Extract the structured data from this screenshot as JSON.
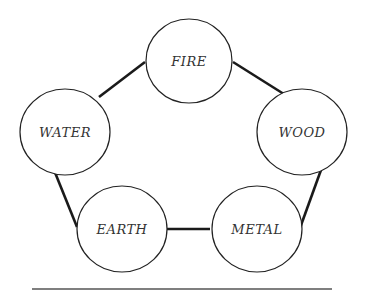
{
  "diagram": {
    "type": "cycle",
    "stroke_color": "#1a1a1a",
    "node_stroke_color": "#222222",
    "label_color": "#333333",
    "nodes": [
      {
        "id": "fire",
        "label": "FIRE",
        "cx": 189,
        "cy": 61,
        "rx": 43,
        "ry": 42
      },
      {
        "id": "wood",
        "label": "WOOD",
        "cx": 302,
        "cy": 132,
        "rx": 45,
        "ry": 43
      },
      {
        "id": "metal",
        "label": "METAL",
        "cx": 257,
        "cy": 229,
        "rx": 45,
        "ry": 43
      },
      {
        "id": "earth",
        "label": "EARTH",
        "cx": 122,
        "cy": 229,
        "rx": 45,
        "ry": 43
      },
      {
        "id": "water",
        "label": "WATER",
        "cx": 65,
        "cy": 132,
        "rx": 45,
        "ry": 43
      }
    ],
    "edges": [
      {
        "from": "water",
        "to": "fire",
        "x1": 99,
        "y1": 97,
        "x2": 145,
        "y2": 62
      },
      {
        "from": "fire",
        "to": "wood",
        "x1": 233,
        "y1": 62,
        "x2": 287,
        "y2": 96
      },
      {
        "from": "wood",
        "to": "metal",
        "x1": 321,
        "y1": 170,
        "x2": 300,
        "y2": 228
      },
      {
        "from": "metal",
        "to": "earth",
        "x1": 210,
        "y1": 229,
        "x2": 167,
        "y2": 229
      },
      {
        "from": "earth",
        "to": "water",
        "x1": 77,
        "y1": 227,
        "x2": 54,
        "y2": 170
      }
    ],
    "baseline": {
      "x1": 32,
      "y1": 289,
      "x2": 332,
      "y2": 289,
      "color": "#555555"
    }
  }
}
